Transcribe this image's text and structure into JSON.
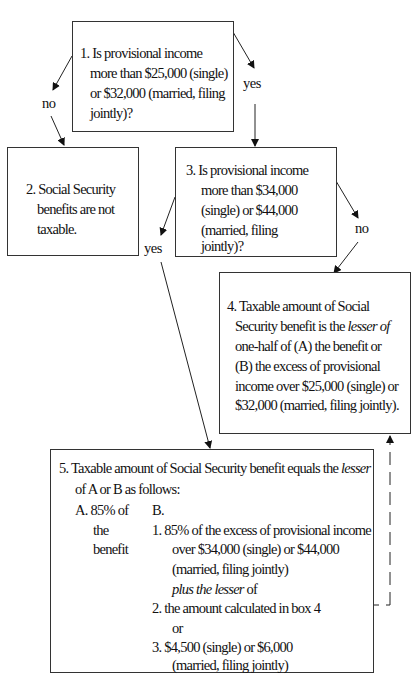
{
  "diagram": {
    "type": "flowchart",
    "topic": "Taxation of Social Security benefits",
    "box1": {
      "lines": [
        "1.  Is provisional income",
        "more than $25,000 (single)",
        "or $32,000 (married, filing",
        "jointly)?"
      ]
    },
    "box2": {
      "lines": [
        "2.  Social Security",
        "benefits are not",
        "taxable."
      ]
    },
    "box3": {
      "lines": [
        "3.  Is provisional income",
        "more than $34,000",
        "(single) or $44,000",
        "(married, filing",
        "jointly)?"
      ]
    },
    "box4": {
      "line1": "4.  Taxable amount of Social",
      "line2_pre": "Security benefit is the ",
      "line2_em": "lesser of",
      "line3": "one-half of (A) the benefit or",
      "line4": "(B) the excess of provisional",
      "line5": "income over $25,000 (single) or",
      "line6": "$32,000 (married, filing jointly)."
    },
    "box5": {
      "line1_pre": "5.  Taxable amount of Social Security benefit equals the ",
      "line1_em": "lesser",
      "line2": "of A or B as follows:",
      "colA": [
        "A.  85% of",
        "the",
        "benefit"
      ],
      "colB_header": "B.",
      "b1_lines": [
        "1.   85% of the excess of provisional income",
        "over $34,000 (single) or $44,000",
        "(married, filing jointly)"
      ],
      "plus_em": "plus the lesser",
      "plus_tail": " of",
      "b2": "2.  the amount calculated in box 4",
      "or": "or",
      "b3_lines": [
        "3.  $4,500 (single) or $6,000",
        "(married, filing jointly)"
      ]
    },
    "edges": [
      {
        "from": "box1",
        "to": "box2",
        "label": "no"
      },
      {
        "from": "box1",
        "to": "box3",
        "label": "yes"
      },
      {
        "from": "box3",
        "to": "box5",
        "label": "yes"
      },
      {
        "from": "box3",
        "to": "box4",
        "label": "no"
      },
      {
        "from": "box5",
        "to": "box4",
        "label": "",
        "style": "dashed"
      }
    ],
    "labels": {
      "box1_no": "no",
      "box1_yes": "yes",
      "box3_yes": "yes",
      "box3_no": "no"
    }
  }
}
